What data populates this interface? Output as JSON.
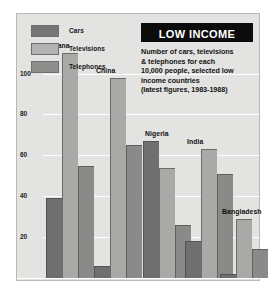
{
  "headline": {
    "title": "LOW INCOME",
    "blurb_lines": [
      "Number of cars, televisions",
      "& telephones for each",
      "10,000 people, selected low",
      "income countries",
      "(latest figures, 1983-1988)"
    ]
  },
  "legend": {
    "items": [
      {
        "label": "Cars",
        "color": "#767676"
      },
      {
        "label": "Televisions",
        "color": "#b3b3b1"
      },
      {
        "label": "Telephones",
        "color": "#8e8e8c"
      }
    ]
  },
  "chart_data": {
    "type": "bar",
    "title": "LOW INCOME",
    "subtitle": "Number of cars, televisions & telephones for each 10,000 people, selected low income countries (latest figures, 1983-1988)",
    "xlabel": "",
    "ylabel": "",
    "ylim": [
      0,
      112
    ],
    "yticks": [
      20,
      40,
      60,
      80,
      100
    ],
    "grid": true,
    "legend_position": "top-left",
    "categories": [
      "Ghana",
      "China",
      "Nigeria",
      "India",
      "Bangladesh"
    ],
    "series": [
      {
        "name": "Cars",
        "color": "#6f6f6f",
        "values": [
          39,
          6,
          67,
          18,
          2
        ]
      },
      {
        "name": "Televisions",
        "color": "#a9a9a7",
        "values": [
          110,
          98,
          54,
          63,
          29
        ]
      },
      {
        "name": "Telephones",
        "color": "#8a8a88",
        "values": [
          55,
          65,
          26,
          51,
          14
        ]
      }
    ]
  }
}
